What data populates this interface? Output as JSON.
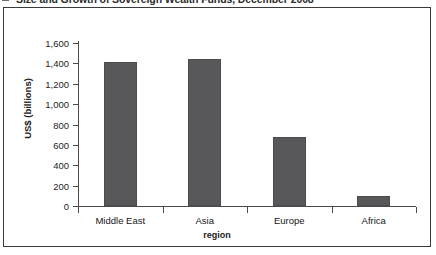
{
  "figure": {
    "title": "Size and Growth of Sovereign Wealth Funds, December 2008",
    "bullet_icon": "square-bullet-icon"
  },
  "chart_data": {
    "type": "bar",
    "title": "Size and Growth of Sovereign Wealth Funds, December 2008",
    "categories": [
      "Middle East",
      "Asia",
      "Europe",
      "Africa"
    ],
    "values": [
      1410,
      1440,
      675,
      95
    ],
    "xlabel": "region",
    "ylabel": "US$ (billions)",
    "ylim": [
      0,
      1600
    ],
    "ytick_values": [
      0,
      200,
      400,
      600,
      800,
      1000,
      1200,
      1400,
      1600
    ],
    "ytick_labels": [
      "0",
      "200",
      "400",
      "600",
      "800",
      "1,000",
      "1,200",
      "1,400",
      "1,600"
    ],
    "grid": false,
    "legend": null,
    "bar_color": "#58585a",
    "axis_color": "#4a4a4c",
    "background": "#ffffff"
  }
}
